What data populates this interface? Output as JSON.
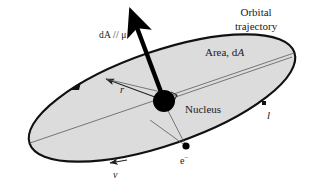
{
  "figure": {
    "background_color": "#ffffff",
    "ellipse_fill_color": "#dcdcdc",
    "stroke_color": "#000000",
    "thin_line_color": "#555555"
  },
  "labels": {
    "orbital_line1": "Orbital",
    "orbital_line2": "trajectory",
    "area_prefix": "Area, d",
    "area_symbol": "A",
    "area_vector": "dA // μ",
    "nucleus": "Nucleus",
    "radius": "r",
    "angular_momentum": "l",
    "electron": "e",
    "electron_charge": "−",
    "velocity": "v"
  },
  "geometry": {
    "ellipse_center_x": 162,
    "ellipse_center_y": 98,
    "ellipse_rx": 140,
    "ellipse_ry": 47,
    "ellipse_rotation_deg": -19,
    "nucleus_x": 164,
    "nucleus_y": 101,
    "nucleus_radius": 11,
    "electron_x": 186,
    "electron_y": 146,
    "electron_radius": 3.5,
    "vector_tip_x": 130,
    "vector_tip_y": 11,
    "l_tick_x": 264,
    "l_tick_y": 103
  }
}
